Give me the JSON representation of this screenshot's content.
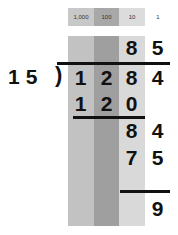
{
  "place_values": {
    "headers": [
      "1,000",
      "100",
      "10",
      "1"
    ],
    "header_colors": [
      "#c8c8c8",
      "#a8a8a8",
      "#dcdcdc",
      "#ffffff"
    ],
    "column_colors": [
      "#c2c2c2",
      "#9f9f9f",
      "#d9d9d9",
      "#ffffff"
    ]
  },
  "division": {
    "divisor": "15",
    "bracket": ")",
    "dividend": [
      "1",
      "2",
      "8",
      "4"
    ],
    "quotient": [
      "8",
      "5"
    ],
    "steps": [
      {
        "digits": [
          "1",
          "2",
          "0"
        ]
      },
      {
        "digits": [
          "8",
          "4"
        ]
      },
      {
        "digits": [
          "7",
          "5"
        ]
      },
      {
        "digits": [
          "9"
        ]
      }
    ],
    "remainder": "9"
  }
}
